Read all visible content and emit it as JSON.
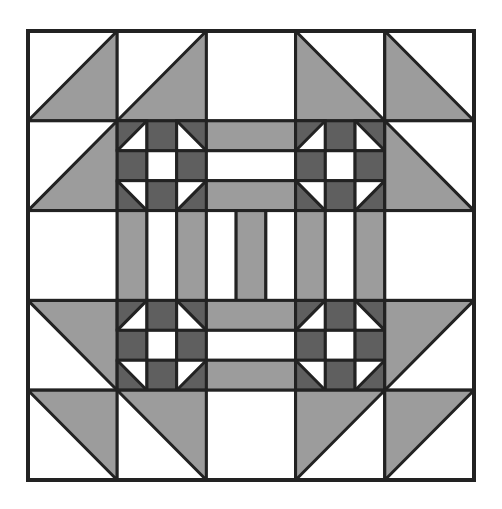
{
  "diagram": {
    "type": "quilt-block",
    "grid": {
      "rows": 5,
      "cols": 5
    },
    "colors": {
      "background": "#ffffff",
      "light": "#ffffff",
      "medium": "#9c9c9c",
      "dark": "#5f5f5f",
      "line": "#222222"
    },
    "cells": [
      [
        {
          "type": "hst",
          "shade": "br"
        },
        {
          "type": "hst",
          "shade": "br"
        },
        {
          "type": "plain"
        },
        {
          "type": "hst",
          "shade": "bl"
        },
        {
          "type": "hst",
          "shade": "bl"
        }
      ],
      [
        {
          "type": "hst",
          "shade": "br"
        },
        {
          "type": "shoofly"
        },
        {
          "type": "strips-h",
          "pattern": [
            "medium",
            "light",
            "medium"
          ]
        },
        {
          "type": "shoofly"
        },
        {
          "type": "hst",
          "shade": "bl"
        }
      ],
      [
        {
          "type": "plain"
        },
        {
          "type": "strips-v",
          "pattern": [
            "medium",
            "light",
            "medium"
          ]
        },
        {
          "type": "strips-v",
          "pattern": [
            "light",
            "medium",
            "light"
          ]
        },
        {
          "type": "strips-v",
          "pattern": [
            "medium",
            "light",
            "medium"
          ]
        },
        {
          "type": "plain"
        }
      ],
      [
        {
          "type": "hst",
          "shade": "tr"
        },
        {
          "type": "shoofly"
        },
        {
          "type": "strips-h",
          "pattern": [
            "medium",
            "light",
            "medium"
          ]
        },
        {
          "type": "shoofly"
        },
        {
          "type": "hst",
          "shade": "tl"
        }
      ],
      [
        {
          "type": "hst",
          "shade": "tr"
        },
        {
          "type": "hst",
          "shade": "tr"
        },
        {
          "type": "plain"
        },
        {
          "type": "hst",
          "shade": "tl"
        },
        {
          "type": "hst",
          "shade": "tl"
        }
      ]
    ],
    "units": {
      "hst": "half-square triangle (medium shaded half)",
      "shoofly": "3x3 shoo-fly unit: dark edges, light center, corner half-square triangles",
      "strips": "three-strip rail unit"
    }
  }
}
